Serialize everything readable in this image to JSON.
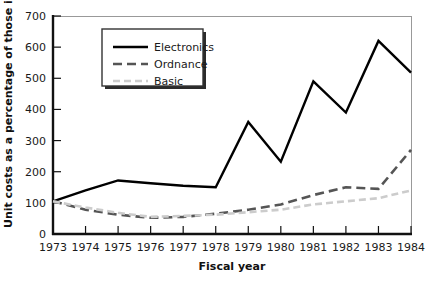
{
  "chart_data": {
    "type": "line",
    "title": "",
    "xlabel": "Fiscal year",
    "ylabel": "Unit costs as a percentage of those in FY 1973",
    "categories": [
      1973,
      1974,
      1975,
      1976,
      1977,
      1978,
      1979,
      1980,
      1981,
      1982,
      1983,
      1984
    ],
    "x": [
      1973,
      1974,
      1975,
      1976,
      1977,
      1978,
      1979,
      1980,
      1981,
      1982,
      1983,
      1984
    ],
    "xlim": [
      1973,
      1984
    ],
    "ylim": [
      0,
      700
    ],
    "yticks": [
      0,
      100,
      200,
      300,
      400,
      500,
      600,
      700
    ],
    "xticks": [
      1973,
      1974,
      1975,
      1976,
      1977,
      1978,
      1979,
      1980,
      1981,
      1982,
      1983,
      1984
    ],
    "grid": false,
    "legend_position": "upper-left-inside",
    "series": [
      {
        "name": "Electronics",
        "color": "#000000",
        "style": "solid",
        "values": [
          105,
          140,
          172,
          163,
          155,
          150,
          360,
          232,
          490,
          390,
          620,
          518
        ]
      },
      {
        "name": "Ordnance",
        "color": "#555555",
        "style": "dashed",
        "values": [
          105,
          78,
          62,
          52,
          55,
          65,
          78,
          95,
          125,
          150,
          145,
          270
        ]
      },
      {
        "name": "Basic",
        "color": "#cccccc",
        "style": "dotted",
        "values": [
          105,
          85,
          68,
          55,
          58,
          62,
          70,
          78,
          95,
          105,
          115,
          140
        ]
      }
    ]
  },
  "axes": {
    "y_tick_labels": [
      "0",
      "100",
      "200",
      "300",
      "400",
      "500",
      "600",
      "700"
    ],
    "x_tick_labels": [
      "1973",
      "1974",
      "1975",
      "1976",
      "1977",
      "1978",
      "1979",
      "1980",
      "1981",
      "1982",
      "1983",
      "1984"
    ],
    "x_axis_title": "Fiscal year",
    "y_axis_title": "Unit costs as a percentage of those in FY 1973"
  },
  "legend": {
    "items": [
      {
        "label": "Electronics",
        "color": "#000000",
        "style": "solid"
      },
      {
        "label": "Ordnance",
        "color": "#555555",
        "style": "dashed"
      },
      {
        "label": "Basic",
        "color": "#cccccc",
        "style": "dotted"
      }
    ]
  },
  "colors": {
    "background": "#ffffff",
    "axis": "#111111",
    "text": "#1a1a1a",
    "electronics": "#000000",
    "ordnance": "#555555",
    "basic": "#cccccc",
    "legend_border": "#333333",
    "legend_shadow": "#222222"
  }
}
